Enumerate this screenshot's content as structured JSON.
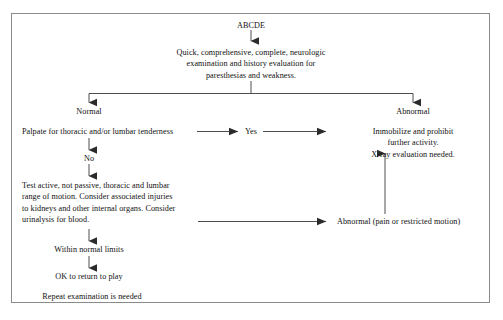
{
  "document": {
    "type": "clinical-decision-flowchart",
    "border_color": "#8b8b8b",
    "line_color": "#3a3a3a",
    "text_color": "#111111",
    "background": "#ffffff"
  },
  "nodes": {
    "start": "ABCDE",
    "assessment": "Quick, comprehensive, complete, neurologic\nexamination and history evaluation for\nparesthesias and weakness.",
    "branch_normal": "Normal",
    "branch_abnormal": "Abnormal",
    "palpate": "Palpate for thoracic and/or lumbar tenderness",
    "yes": "Yes",
    "no": "No",
    "immobilize": "Immobilize and prohibit further activity.\nX-ray evaluation needed.",
    "test_motion": "Test active, not passive, thoracic and lumbar\nrange of motion. Consider associated injuries\nto kidneys and other internal organs. Consider\nurinalysis for blood.",
    "abnormal_pain": "Abnormal (pain or restricted motion)",
    "within_limits": "Within normal limits",
    "ok_return": "OK to return to play",
    "repeat_exam": "Repeat examination is needed"
  },
  "edges": [
    {
      "id": "start-to-assessment",
      "label": "",
      "from": "start",
      "to": "assessment",
      "direction": "down"
    },
    {
      "id": "assessment-to-split",
      "label": "",
      "from": "assessment",
      "to": "branch-split",
      "direction": "down"
    },
    {
      "id": "split-to-normal",
      "label": "",
      "from": "branch-split",
      "to": "branch_normal",
      "direction": "down"
    },
    {
      "id": "split-to-abnormal",
      "label": "",
      "from": "branch-split",
      "to": "branch_abnormal",
      "direction": "down"
    },
    {
      "id": "palpate-to-yes",
      "label": "",
      "from": "palpate",
      "to": "yes",
      "direction": "right"
    },
    {
      "id": "yes-to-immobilize",
      "label": "",
      "from": "yes",
      "to": "immobilize",
      "direction": "right"
    },
    {
      "id": "palpate-to-no",
      "label": "",
      "from": "palpate",
      "to": "no",
      "direction": "down"
    },
    {
      "id": "no-to-test",
      "label": "",
      "from": "no",
      "to": "test_motion",
      "direction": "down"
    },
    {
      "id": "test-to-abnormal-pain",
      "label": "",
      "from": "test_motion",
      "to": "abnormal_pain",
      "direction": "right"
    },
    {
      "id": "abnormal-pain-to-immobilize",
      "label": "",
      "from": "abnormal_pain",
      "to": "immobilize",
      "direction": "up"
    },
    {
      "id": "test-to-within-limits",
      "label": "",
      "from": "test_motion",
      "to": "within_limits",
      "direction": "down"
    },
    {
      "id": "within-limits-to-ok",
      "label": "",
      "from": "within_limits",
      "to": "ok_return",
      "direction": "down"
    }
  ]
}
